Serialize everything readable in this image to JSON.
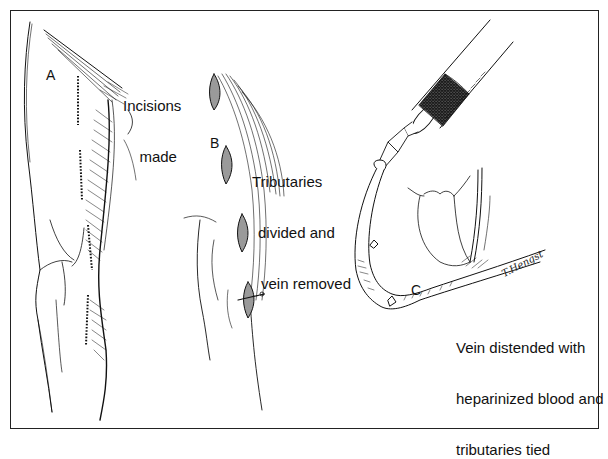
{
  "figure": {
    "panels": [
      {
        "letter": "A",
        "caption_lines": [
          "Incisions",
          "made"
        ],
        "depicts": "leg-with-dotted-incision-lines"
      },
      {
        "letter": "B",
        "caption_lines": [
          "Tributaries",
          "divided and",
          "vein removed"
        ],
        "depicts": "leg-with-open-incisions-vein-removed"
      },
      {
        "letter": "C",
        "caption_lines": [
          "Vein distended with",
          "heparinized blood and",
          "tributaries tied"
        ],
        "depicts": "syringe-distending-harvested-vein"
      }
    ],
    "signature": "T.Hengst",
    "colors": {
      "ink": "#111111",
      "background": "#ffffff",
      "syringe_stipple": "#8a8a8a"
    }
  }
}
